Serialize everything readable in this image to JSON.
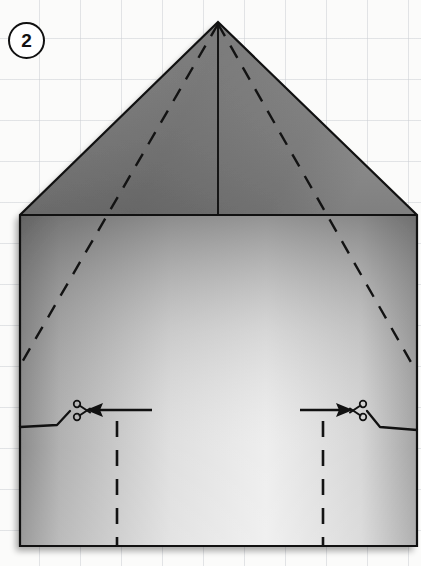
{
  "diagram": {
    "step_number": "2",
    "figure_type": "folded-paper-house-shape",
    "canvas": {
      "width": 421,
      "height": 566
    },
    "background": {
      "color": "#fbfbfa",
      "grid": true,
      "grid_color": "#cdd0d4",
      "grid_spacing": 41
    },
    "shape": {
      "name": "house-outline",
      "outline_color": "#111111",
      "outline_width": 2.2,
      "points": "218,22 417,215 417,546 20,546 20,215",
      "roof_fill_start": "#6f6f6f",
      "roof_fill_end": "#8b8b8b",
      "body_fill_start": "#8a8a8a",
      "body_fill_mid": "#efefef",
      "body_fill_end": "#d9d9d9"
    },
    "fold_lines": [
      {
        "name": "center-vertical-solid-fold",
        "style": "solid",
        "from": [
          218,
          22
        ],
        "to": [
          218,
          215
        ]
      },
      {
        "name": "left-diagonal-dashed-fold",
        "style": "dashed",
        "from": [
          218,
          22
        ],
        "to": [
          21,
          363
        ]
      },
      {
        "name": "right-diagonal-dashed-fold",
        "style": "dashed",
        "from": [
          218,
          22
        ],
        "to": [
          416,
          370
        ]
      },
      {
        "name": "left-vertical-dashed-fold",
        "style": "dashed",
        "from": [
          117,
          420
        ],
        "to": [
          117,
          546
        ]
      },
      {
        "name": "right-vertical-dashed-fold",
        "style": "dashed",
        "from": [
          323,
          420
        ],
        "to": [
          323,
          546
        ]
      }
    ],
    "cut_marks": [
      {
        "name": "left-cut-mark",
        "scissors_position": [
          77,
          410
        ],
        "arrow_direction": "left",
        "arrow_from": [
          152,
          410
        ],
        "arrow_to": [
          90,
          410
        ],
        "cut_line": "20,425 63,425 63,410"
      },
      {
        "name": "right-cut-mark",
        "scissors_position": [
          360,
          410
        ],
        "arrow_direction": "right",
        "arrow_from": [
          300,
          410
        ],
        "arrow_to": [
          352,
          410
        ],
        "cut_line": "417,428 374,428 374,410"
      }
    ],
    "legend": {
      "dashed_meaning": "fold line",
      "solid_meaning": "edge / cut line",
      "scissors_meaning": "cut here"
    }
  }
}
